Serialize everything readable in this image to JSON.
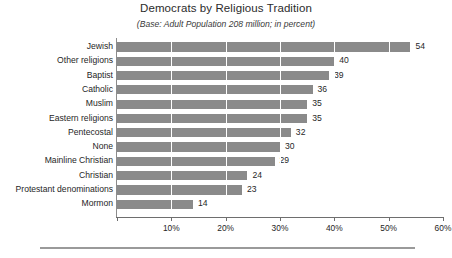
{
  "chart_data": {
    "type": "bar",
    "orientation": "horizontal",
    "title": "Democrats by Religious Tradition",
    "subtitle": "(Base: Adult Population 208 million; in percent)",
    "xlabel": "",
    "ylabel": "",
    "xlim": [
      0,
      60
    ],
    "grid": true,
    "grid_axis": "x",
    "legend": false,
    "bar_color": "#8a8a8a",
    "categories": [
      "Jewish",
      "Other religions",
      "Baptist",
      "Catholic",
      "Muslim",
      "Eastern religions",
      "Pentecostal",
      "None",
      "Mainline Christian",
      "Christian",
      "Protestant denominations",
      "Mormon"
    ],
    "values": [
      54,
      40,
      39,
      36,
      35,
      35,
      32,
      30,
      29,
      24,
      23,
      14
    ],
    "value_labels": [
      "54",
      "40",
      "39",
      "36",
      "35",
      "35",
      "32",
      "30",
      "29",
      "24",
      "23",
      "14"
    ],
    "xticks": [
      0,
      10,
      20,
      30,
      40,
      50,
      60
    ],
    "xticklabels": [
      "",
      "10%",
      "20%",
      "30%",
      "40%",
      "50%",
      "60%"
    ]
  }
}
